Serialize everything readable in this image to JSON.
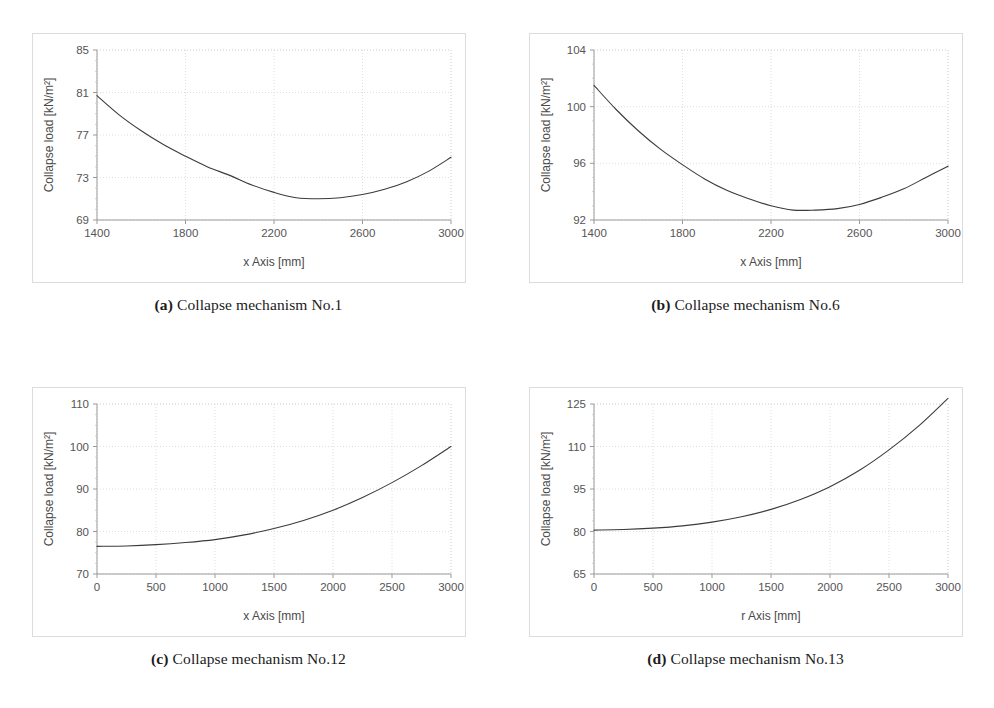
{
  "figure": {
    "panel_count": 4,
    "background_color": "#ffffff",
    "frame_color": "#dcdcdc",
    "curve_color": "#3b3b3b",
    "grid_color": "#d6d6d6",
    "axis_color": "#9a9a9a"
  },
  "panels": [
    {
      "key": "a",
      "caption_letter": "(a)",
      "caption_text": "Collapse mechanism No.1",
      "chart_data": {
        "type": "line",
        "title": "",
        "xlabel": "x Axis [mm]",
        "ylabel": "Collapse load [kN/m²]",
        "xlim": [
          1400,
          3000
        ],
        "ylim": [
          69,
          85
        ],
        "xticks": [
          1400,
          1800,
          2200,
          2600,
          3000
        ],
        "yticks": [
          69,
          73,
          77,
          81,
          85
        ],
        "xtick_labels": [
          "1400",
          "1800",
          "2200",
          "2600",
          "3000"
        ],
        "ytick_labels": [
          "69",
          "73",
          "77",
          "81",
          "85"
        ],
        "grid": true,
        "legend": false,
        "series": [
          {
            "name": "Collapse load",
            "x": [
              1400,
              1500,
              1600,
              1700,
              1800,
              1900,
              2000,
              2100,
              2200,
              2300,
              2400,
              2500,
              2600,
              2700,
              2800,
              2900,
              3000
            ],
            "y": [
              80.7,
              78.9,
              77.4,
              76.1,
              75.0,
              74.0,
              73.2,
              72.3,
              71.6,
              71.1,
              71.0,
              71.1,
              71.4,
              71.9,
              72.6,
              73.6,
              74.9
            ]
          }
        ],
        "annotations": {
          "minimum_y": 71.0,
          "minimum_x": 2400,
          "start_y": 80.7,
          "end_y": 74.9
        }
      }
    },
    {
      "key": "b",
      "caption_letter": "(b)",
      "caption_text": "Collapse mechanism No.6",
      "chart_data": {
        "type": "line",
        "title": "",
        "xlabel": "x Axis [mm]",
        "ylabel": "Collapse load [kN/m²]",
        "xlim": [
          1400,
          3000
        ],
        "ylim": [
          92,
          104
        ],
        "xticks": [
          1400,
          1800,
          2200,
          2600,
          3000
        ],
        "yticks": [
          92,
          96,
          100,
          104
        ],
        "xtick_labels": [
          "1400",
          "1800",
          "2200",
          "2600",
          "3000"
        ],
        "ytick_labels": [
          "92",
          "96",
          "100",
          "104"
        ],
        "grid": true,
        "legend": false,
        "series": [
          {
            "name": "Collapse load",
            "x": [
              1400,
              1500,
              1600,
              1700,
              1800,
              1900,
              2000,
              2100,
              2200,
              2300,
              2400,
              2500,
              2600,
              2700,
              2800,
              2900,
              3000
            ],
            "y": [
              101.5,
              99.8,
              98.3,
              97.0,
              95.9,
              94.9,
              94.1,
              93.5,
              93.0,
              92.7,
              92.7,
              92.8,
              93.1,
              93.6,
              94.2,
              95.0,
              95.8
            ]
          }
        ],
        "annotations": {
          "minimum_y": 92.7,
          "minimum_x": 2350,
          "start_y": 101.5,
          "end_y": 95.8
        }
      }
    },
    {
      "key": "c",
      "caption_letter": "(c)",
      "caption_text": "Collapse mechanism No.12",
      "chart_data": {
        "type": "line",
        "title": "",
        "xlabel": "x Axis [mm]",
        "ylabel": "Collapse load [kN/m²]",
        "xlim": [
          0,
          3000
        ],
        "ylim": [
          70,
          110
        ],
        "xticks": [
          0,
          500,
          1000,
          1500,
          2000,
          2500,
          3000
        ],
        "yticks": [
          70,
          80,
          90,
          100,
          110
        ],
        "xtick_labels": [
          "0",
          "500",
          "1000",
          "1500",
          "2000",
          "2500",
          "3000"
        ],
        "ytick_labels": [
          "70",
          "80",
          "90",
          "100",
          "110"
        ],
        "grid": true,
        "legend": false,
        "series": [
          {
            "name": "Collapse load",
            "x": [
              0,
              250,
              500,
              750,
              1000,
              1250,
              1500,
              1750,
              2000,
              2250,
              2500,
              2750,
              3000
            ],
            "y": [
              76.5,
              76.6,
              76.9,
              77.4,
              78.1,
              79.2,
              80.7,
              82.6,
              85.0,
              88.0,
              91.5,
              95.5,
              100.0
            ]
          }
        ],
        "annotations": {
          "start_y": 76.5,
          "end_y": 100.0
        }
      }
    },
    {
      "key": "d",
      "caption_letter": "(d)",
      "caption_text": "Collapse mechanism No.13",
      "chart_data": {
        "type": "line",
        "title": "",
        "xlabel": "r Axis [mm]",
        "ylabel": "Collapse load [kN/m²]",
        "xlim": [
          0,
          3000
        ],
        "ylim": [
          65,
          125
        ],
        "xticks": [
          0,
          500,
          1000,
          1500,
          2000,
          2500,
          3000
        ],
        "yticks": [
          65,
          80,
          95,
          110,
          125
        ],
        "xtick_labels": [
          "0",
          "500",
          "1000",
          "1500",
          "2000",
          "2500",
          "3000"
        ],
        "ytick_labels": [
          "65",
          "80",
          "95",
          "110",
          "125"
        ],
        "grid": true,
        "legend": false,
        "series": [
          {
            "name": "Collapse load",
            "x": [
              0,
              250,
              500,
              750,
              1000,
              1250,
              1500,
              1750,
              2000,
              2250,
              2500,
              2750,
              3000
            ],
            "y": [
              80.5,
              80.7,
              81.2,
              82.0,
              83.3,
              85.2,
              87.8,
              91.3,
              95.8,
              101.6,
              108.8,
              117.2,
              127.0
            ]
          }
        ],
        "annotations": {
          "start_y": 80.5,
          "end_y": 127.0
        }
      }
    }
  ]
}
